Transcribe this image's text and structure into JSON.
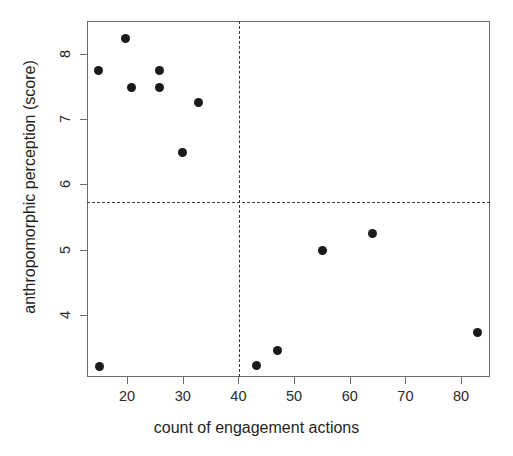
{
  "chart_data": {
    "type": "scatter",
    "title": "",
    "xlabel": "count of engagement actions",
    "ylabel": "anthropomorphic perception (score)",
    "xlim": [
      12.8,
      85.2
    ],
    "ylim": [
      3.05,
      8.5
    ],
    "grid": false,
    "legend": null,
    "xticks": [
      20,
      30,
      40,
      50,
      60,
      70,
      80
    ],
    "xtick_labels": [
      "20",
      "30",
      "40",
      "50",
      "60",
      "70",
      "80"
    ],
    "yticks": [
      4,
      5,
      6,
      7,
      8
    ],
    "ytick_labels": [
      "4",
      "5",
      "6",
      "7",
      "8"
    ],
    "marker": "filled-circle",
    "marker_color": "#1a1a1a",
    "marker_size_px": 9,
    "points": [
      {
        "x": 14.6,
        "y": 7.75
      },
      {
        "x": 19.6,
        "y": 8.24
      },
      {
        "x": 20.7,
        "y": 7.5
      },
      {
        "x": 25.7,
        "y": 7.76
      },
      {
        "x": 25.7,
        "y": 7.5
      },
      {
        "x": 29.8,
        "y": 6.5
      },
      {
        "x": 32.7,
        "y": 7.26
      },
      {
        "x": 14.8,
        "y": 3.22
      },
      {
        "x": 43.1,
        "y": 3.24
      },
      {
        "x": 46.9,
        "y": 3.47
      },
      {
        "x": 54.9,
        "y": 5.0
      },
      {
        "x": 63.9,
        "y": 5.26
      },
      {
        "x": 82.7,
        "y": 3.74
      }
    ],
    "reference_lines": [
      {
        "orientation": "vertical",
        "value": 40,
        "style": "dashed",
        "color": "#3a3a3a"
      },
      {
        "orientation": "horizontal",
        "value": 5.75,
        "style": "dashed",
        "color": "#3a3a3a"
      }
    ]
  },
  "colors": {
    "axis": "#6a6a6a",
    "text": "#1f1f1f",
    "marker": "#1a1a1a",
    "refline": "#3a3a3a",
    "background": "#ffffff"
  }
}
